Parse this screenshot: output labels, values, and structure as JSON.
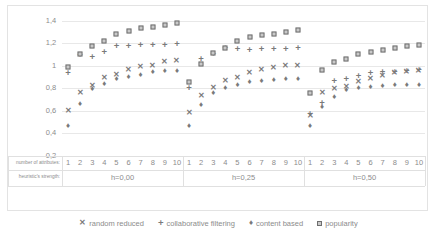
{
  "chart_data": {
    "type": "scatter",
    "title": "",
    "xlabel": "number of attributes:",
    "xlabel2": "heuristic's strength:",
    "ylabel": "",
    "ylim": [
      0.2,
      1.4
    ],
    "ytick_labels": [
      "1,4",
      "1,2",
      "1",
      "0,8",
      "0,6",
      "0,4",
      "0,2"
    ],
    "ytick_values": [
      1.4,
      1.2,
      1.0,
      0.8,
      0.6,
      0.4,
      0.2
    ],
    "grid": true,
    "legend_position": "bottom",
    "groups": [
      {
        "label": "h=0,00",
        "x": [
          1,
          2,
          3,
          4,
          5,
          6,
          7,
          8,
          9,
          10
        ]
      },
      {
        "label": "h=0,25",
        "x": [
          1,
          2,
          3,
          4,
          5,
          6,
          7,
          8,
          9,
          10
        ]
      },
      {
        "label": "h=0,50",
        "x": [
          1,
          2,
          3,
          4,
          5,
          6,
          7,
          8,
          9,
          10
        ]
      }
    ],
    "categories": [
      "1",
      "2",
      "3",
      "4",
      "5",
      "6",
      "7",
      "8",
      "9",
      "10",
      "1",
      "2",
      "3",
      "4",
      "5",
      "6",
      "7",
      "8",
      "9",
      "10",
      "1",
      "2",
      "3",
      "4",
      "5",
      "6",
      "7",
      "8",
      "9",
      "10"
    ],
    "series": [
      {
        "name": "random reduced",
        "marker": "cross",
        "values": [
          0.6,
          0.76,
          0.82,
          0.89,
          0.92,
          0.96,
          0.99,
          1.0,
          1.03,
          1.04,
          0.58,
          0.73,
          0.8,
          0.86,
          0.89,
          0.93,
          0.96,
          0.98,
          1.0,
          1.0,
          0.55,
          0.76,
          0.79,
          0.81,
          0.85,
          0.88,
          0.91,
          0.93,
          0.94,
          0.95
        ]
      },
      {
        "name": "collaborative filtering",
        "marker": "plus",
        "values": [
          0.93,
          1.09,
          1.08,
          1.12,
          1.17,
          1.17,
          1.18,
          1.18,
          1.18,
          1.19,
          0.8,
          1.06,
          1.1,
          1.16,
          1.15,
          1.14,
          1.15,
          1.15,
          1.15,
          1.16,
          0.57,
          0.67,
          0.86,
          0.88,
          0.91,
          0.93,
          0.94,
          0.94,
          0.95,
          0.96
        ]
      },
      {
        "name": "content based",
        "marker": "diamond",
        "values": [
          0.46,
          0.66,
          0.79,
          0.84,
          0.88,
          0.9,
          0.92,
          0.94,
          0.95,
          0.95,
          0.46,
          0.65,
          0.76,
          0.8,
          0.83,
          0.85,
          0.86,
          0.87,
          0.88,
          0.88,
          0.46,
          0.63,
          0.72,
          0.78,
          0.8,
          0.81,
          0.82,
          0.83,
          0.83,
          0.83
        ]
      },
      {
        "name": "popularity",
        "marker": "square",
        "values": [
          0.99,
          1.1,
          1.17,
          1.22,
          1.28,
          1.31,
          1.33,
          1.34,
          1.36,
          1.38,
          0.85,
          1.01,
          1.11,
          1.16,
          1.22,
          1.25,
          1.27,
          1.28,
          1.3,
          1.32,
          0.76,
          0.96,
          1.03,
          1.06,
          1.1,
          1.12,
          1.14,
          1.16,
          1.17,
          1.18
        ]
      }
    ]
  }
}
